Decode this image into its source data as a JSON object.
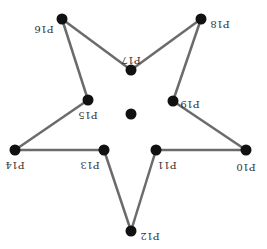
{
  "diagram": {
    "type": "star-polygon",
    "orientation": "rotated-180",
    "colors": {
      "edge": "#6b6b6b",
      "node": "#111111",
      "label": "#333333",
      "background": "#ffffff"
    },
    "nodes": [
      {
        "id": "P10",
        "label": "P10",
        "x": 246,
        "y": 150,
        "lx": 246,
        "ly": 166
      },
      {
        "id": "P11",
        "label": "P11",
        "x": 156,
        "y": 150,
        "lx": 167,
        "ly": 164
      },
      {
        "id": "P12",
        "label": "P12",
        "x": 131,
        "y": 231,
        "lx": 150,
        "ly": 235
      },
      {
        "id": "P13",
        "label": "P13",
        "x": 104,
        "y": 150,
        "lx": 90,
        "ly": 164
      },
      {
        "id": "P14",
        "label": "P14",
        "x": 15,
        "y": 150,
        "lx": 15,
        "ly": 164
      },
      {
        "id": "P15",
        "label": "P15",
        "x": 88,
        "y": 100,
        "lx": 88,
        "ly": 114
      },
      {
        "id": "P16",
        "label": "P16",
        "x": 62,
        "y": 19,
        "lx": 44,
        "ly": 28
      },
      {
        "id": "P17",
        "label": "P17",
        "x": 131,
        "y": 70,
        "lx": 131,
        "ly": 59
      },
      {
        "id": "P18",
        "label": "P18",
        "x": 201,
        "y": 19,
        "lx": 220,
        "ly": 23
      },
      {
        "id": "P19",
        "label": "P19",
        "x": 173,
        "y": 101,
        "lx": 190,
        "ly": 103
      }
    ],
    "center": {
      "x": 131,
      "y": 114
    },
    "edges": [
      [
        "P16",
        "P17"
      ],
      [
        "P17",
        "P18"
      ],
      [
        "P18",
        "P19"
      ],
      [
        "P19",
        "P10"
      ],
      [
        "P10",
        "P11"
      ],
      [
        "P11",
        "P12"
      ],
      [
        "P12",
        "P13"
      ],
      [
        "P13",
        "P14"
      ],
      [
        "P14",
        "P15"
      ],
      [
        "P15",
        "P16"
      ]
    ]
  }
}
